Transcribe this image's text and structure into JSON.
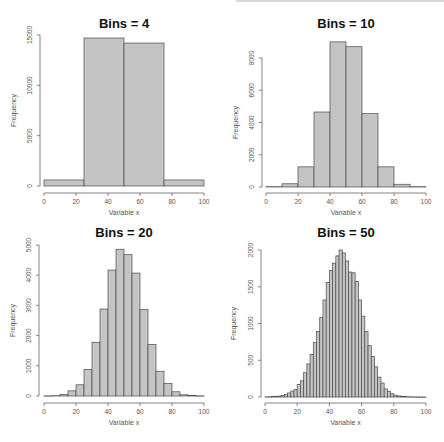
{
  "chart_data": [
    {
      "type": "bar",
      "title": "Bins = 4",
      "xlabel": "Variable x",
      "ylabel": "Frequency",
      "xlim": [
        0,
        100
      ],
      "ylim": [
        0,
        15000
      ],
      "xticks": [
        0,
        20,
        40,
        60,
        80,
        100
      ],
      "yticks": [
        0,
        5000,
        10000,
        15000
      ],
      "bin_edges": [
        0,
        25,
        50,
        75,
        100
      ],
      "values": [
        600,
        14700,
        14200,
        600
      ],
      "grid": false,
      "legend": null
    },
    {
      "type": "bar",
      "title": "Bins = 10",
      "xlabel": "Variable x",
      "ylabel": "Frequency",
      "xlim": [
        0,
        100
      ],
      "ylim": [
        0,
        8000
      ],
      "xticks": [
        0,
        20,
        40,
        60,
        80,
        100
      ],
      "yticks": [
        0,
        2000,
        4000,
        6000,
        8000
      ],
      "bin_edges": [
        0,
        10,
        20,
        30,
        40,
        50,
        60,
        70,
        80,
        90,
        100
      ],
      "values": [
        20,
        200,
        1250,
        4650,
        9000,
        8700,
        4550,
        1250,
        170,
        20
      ],
      "grid": false,
      "legend": null
    },
    {
      "type": "bar",
      "title": "Bins = 20",
      "xlabel": "Variable x",
      "ylabel": "Frequency",
      "xlim": [
        0,
        100
      ],
      "ylim": [
        0,
        5000
      ],
      "xticks": [
        0,
        20,
        40,
        60,
        80,
        100
      ],
      "yticks": [
        0,
        1000,
        2000,
        3000,
        4000,
        5000
      ],
      "bin_edges": [
        0,
        5,
        10,
        15,
        20,
        25,
        30,
        35,
        40,
        45,
        50,
        55,
        60,
        65,
        70,
        75,
        80,
        85,
        90,
        95,
        100
      ],
      "values": [
        5,
        10,
        50,
        170,
        370,
        880,
        1780,
        2880,
        4170,
        4860,
        4680,
        4070,
        2870,
        1710,
        820,
        420,
        140,
        40,
        15,
        5
      ],
      "grid": false,
      "legend": null
    },
    {
      "type": "bar",
      "title": "Bins = 50",
      "xlabel": "Variable x",
      "ylabel": "Frequency",
      "xlim": [
        0,
        100
      ],
      "ylim": [
        0,
        2000
      ],
      "xticks": [
        0,
        20,
        40,
        60,
        80,
        100
      ],
      "yticks": [
        0,
        500,
        1000,
        1500,
        2000
      ],
      "bin_edges_step": 2,
      "values": [
        2,
        3,
        5,
        8,
        12,
        20,
        35,
        55,
        80,
        100,
        170,
        220,
        330,
        450,
        580,
        740,
        890,
        1080,
        1320,
        1560,
        1720,
        1820,
        1920,
        2000,
        1960,
        1850,
        1700,
        1690,
        1570,
        1320,
        1100,
        890,
        700,
        550,
        410,
        270,
        190,
        110,
        75,
        45,
        25,
        15,
        10,
        5,
        3,
        2,
        1,
        1,
        0,
        0
      ],
      "grid": false,
      "legend": null
    }
  ]
}
